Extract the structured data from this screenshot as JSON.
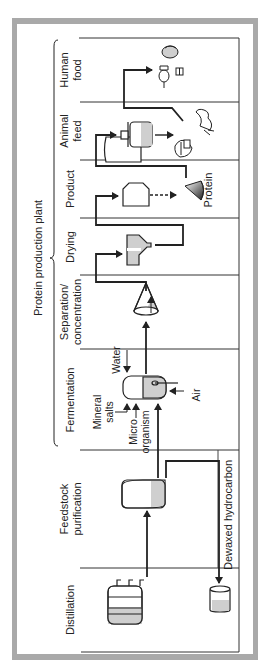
{
  "title": "Protein production plant",
  "stages": [
    {
      "id": "human-food",
      "lines": [
        "Human",
        "food"
      ]
    },
    {
      "id": "animal-feed",
      "lines": [
        "Animal",
        "feed"
      ]
    },
    {
      "id": "product",
      "lines": [
        "Product"
      ]
    },
    {
      "id": "drying",
      "lines": [
        "Drying"
      ]
    },
    {
      "id": "separation",
      "lines": [
        "Separation/",
        "concentration"
      ]
    },
    {
      "id": "fermentation",
      "lines": [
        "Fermentation"
      ]
    },
    {
      "id": "feedstock",
      "lines": [
        "Feedstock",
        "purification"
      ]
    },
    {
      "id": "distillation",
      "lines": [
        "Distillation"
      ]
    }
  ],
  "inputs": {
    "water": "Water",
    "mineral_salts_1": "Mineral",
    "mineral_salts_2": "salts",
    "micro_1": "Micro",
    "micro_2": "organism",
    "air": "Air"
  },
  "labels": {
    "protein": "Protein",
    "dewaxed": "Dewaxed hydrocarbon"
  },
  "colors": {
    "frame": "#a9a9a9",
    "line": "#222222",
    "fill": "#cfcfcf"
  }
}
